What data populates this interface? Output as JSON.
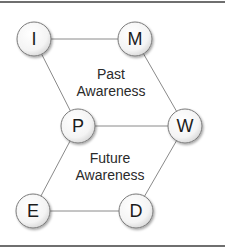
{
  "diagram": {
    "nodes": [
      {
        "id": "I",
        "label": "I",
        "cx": 34,
        "cy": 39
      },
      {
        "id": "M",
        "label": "M",
        "cx": 135,
        "cy": 39
      },
      {
        "id": "P",
        "label": "P",
        "cx": 78,
        "cy": 126
      },
      {
        "id": "W",
        "label": "W",
        "cx": 185,
        "cy": 126
      },
      {
        "id": "E",
        "label": "E",
        "cx": 33,
        "cy": 211
      },
      {
        "id": "D",
        "label": "D",
        "cx": 136,
        "cy": 211
      }
    ],
    "edges": [
      [
        "I",
        "M"
      ],
      [
        "I",
        "P"
      ],
      [
        "M",
        "W"
      ],
      [
        "P",
        "W"
      ],
      [
        "P",
        "E"
      ],
      [
        "W",
        "D"
      ],
      [
        "E",
        "D"
      ]
    ],
    "regions": {
      "past": {
        "line1": "Past",
        "line2": "Awareness"
      },
      "future": {
        "line1": "Future",
        "line2": "Awareness"
      }
    },
    "colors": {
      "edge": "#8a8a8a",
      "node_border": "#7a7a7a",
      "frame": "#6f6f6f"
    }
  }
}
